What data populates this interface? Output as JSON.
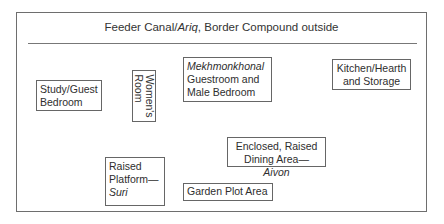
{
  "diagram": {
    "header": {
      "prefix": "Feeder Canal/",
      "italic": "Ariq",
      "suffix": ", Border Compound outside"
    },
    "rooms": [
      {
        "id": "study",
        "lines": [
          "Study/Guest",
          "Bedroom"
        ]
      },
      {
        "id": "womens",
        "lines": [
          "Women's",
          "Room"
        ],
        "orientation": "rotated-90"
      },
      {
        "id": "mekhmonkhonal",
        "italic_line": "Mekhmonkhonal",
        "lines": [
          "Guestroom and",
          "Male Bedroom"
        ]
      },
      {
        "id": "kitchen",
        "lines": [
          "Kitchen/Hearth",
          "and Storage"
        ]
      },
      {
        "id": "dining",
        "lines": [
          "Enclosed, Raised"
        ],
        "line2_prefix": "Dining Area—",
        "line2_italic": "Aivon"
      },
      {
        "id": "platform",
        "lines": [
          "Raised",
          "Platform—"
        ],
        "italic_line": "Suri"
      },
      {
        "id": "garden",
        "lines": [
          "Garden Plot Area"
        ]
      }
    ]
  }
}
